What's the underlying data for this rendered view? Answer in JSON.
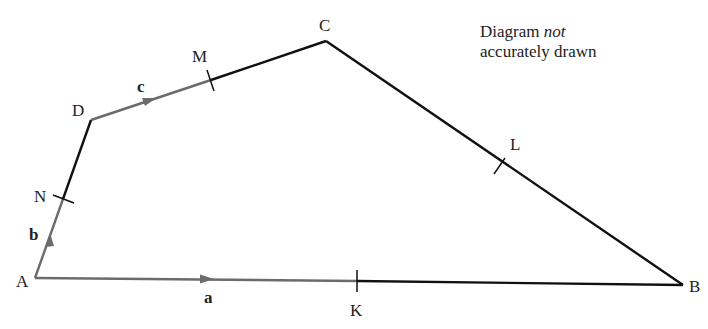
{
  "header_fragment": "... in the quadrilateral ...",
  "note": {
    "line1_prefix": "Diagram ",
    "line1_italic": "not",
    "line2": "accurately drawn"
  },
  "points": {
    "A": {
      "label": "A",
      "x": 35,
      "y": 278
    },
    "B": {
      "label": "B",
      "x": 683,
      "y": 285
    },
    "C": {
      "label": "C",
      "x": 326,
      "y": 41
    },
    "D": {
      "label": "D",
      "x": 91,
      "y": 120
    },
    "K": {
      "label": "K",
      "x": 357,
      "y": 281
    },
    "L": {
      "label": "L",
      "x": 501,
      "y": 166
    },
    "M": {
      "label": "M",
      "x": 211,
      "y": 80
    },
    "N": {
      "label": "N",
      "x": 63,
      "y": 199
    }
  },
  "vectors": {
    "a": {
      "label": "a",
      "from": "A",
      "to": "K"
    },
    "b": {
      "label": "b",
      "from": "A",
      "to": "N"
    },
    "c": {
      "label": "c",
      "from": "D",
      "to": "M"
    }
  },
  "colors": {
    "line": "#111111",
    "vector": "#6b6b6b"
  }
}
